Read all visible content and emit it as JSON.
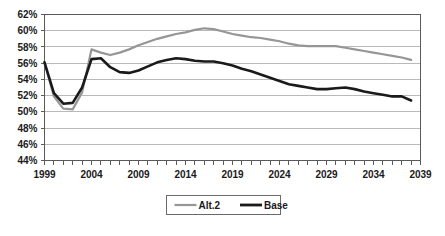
{
  "chart_data": {
    "type": "line",
    "title": "",
    "xlabel": "",
    "ylabel": "",
    "xlim": [
      1999,
      2039
    ],
    "ylim": [
      44,
      62
    ],
    "y_tick_step": 2,
    "x_tick_step": 1,
    "x_label_step": 5,
    "grid": true,
    "legend_position": "bottom-center",
    "y_ticklabels": [
      "44%",
      "46%",
      "48%",
      "50%",
      "52%",
      "54%",
      "56%",
      "58%",
      "60%",
      "62%"
    ],
    "y_tickvalues": [
      44,
      46,
      48,
      50,
      52,
      54,
      56,
      58,
      60,
      62
    ],
    "x_ticklabels": [
      "1999",
      "2004",
      "2009",
      "2014",
      "2019",
      "2024",
      "2029",
      "2034",
      "2039"
    ],
    "x_tickvalues": [
      1999,
      2004,
      2009,
      2014,
      2019,
      2024,
      2029,
      2034,
      2039
    ],
    "x": [
      1999,
      2000,
      2001,
      2002,
      2003,
      2004,
      2005,
      2006,
      2007,
      2008,
      2009,
      2010,
      2011,
      2012,
      2013,
      2014,
      2015,
      2016,
      2017,
      2018,
      2019,
      2020,
      2021,
      2022,
      2023,
      2024,
      2025,
      2026,
      2027,
      2028,
      2029,
      2030,
      2031,
      2032,
      2033,
      2034,
      2035,
      2036,
      2037,
      2038
    ],
    "series": [
      {
        "name": "Alt.2",
        "color": "#969696",
        "line_width": 2.2,
        "values": [
          56.1,
          51.9,
          50.4,
          50.3,
          52.4,
          57.7,
          57.3,
          57.0,
          57.3,
          57.7,
          58.2,
          58.6,
          59.0,
          59.3,
          59.6,
          59.8,
          60.1,
          60.3,
          60.2,
          59.9,
          59.6,
          59.4,
          59.2,
          59.1,
          58.9,
          58.7,
          58.4,
          58.2,
          58.1,
          58.1,
          58.1,
          58.1,
          57.9,
          57.7,
          57.5,
          57.3,
          57.1,
          56.9,
          56.7,
          56.4
        ]
      },
      {
        "name": "Base",
        "color": "#1a1a1a",
        "line_width": 2.6,
        "values": [
          56.1,
          52.3,
          51.0,
          51.1,
          53.0,
          56.5,
          56.6,
          55.5,
          54.9,
          54.8,
          55.1,
          55.6,
          56.1,
          56.4,
          56.6,
          56.5,
          56.3,
          56.2,
          56.2,
          56.0,
          55.7,
          55.3,
          55.0,
          54.6,
          54.2,
          53.8,
          53.4,
          53.2,
          53.0,
          52.8,
          52.8,
          52.9,
          53.0,
          52.8,
          52.5,
          52.3,
          52.1,
          51.9,
          51.9,
          51.4
        ]
      }
    ],
    "legend": [
      {
        "label": "Alt.2",
        "color": "#969696",
        "line_width": 2.2
      },
      {
        "label": "Base",
        "color": "#1a1a1a",
        "line_width": 2.8
      }
    ]
  }
}
